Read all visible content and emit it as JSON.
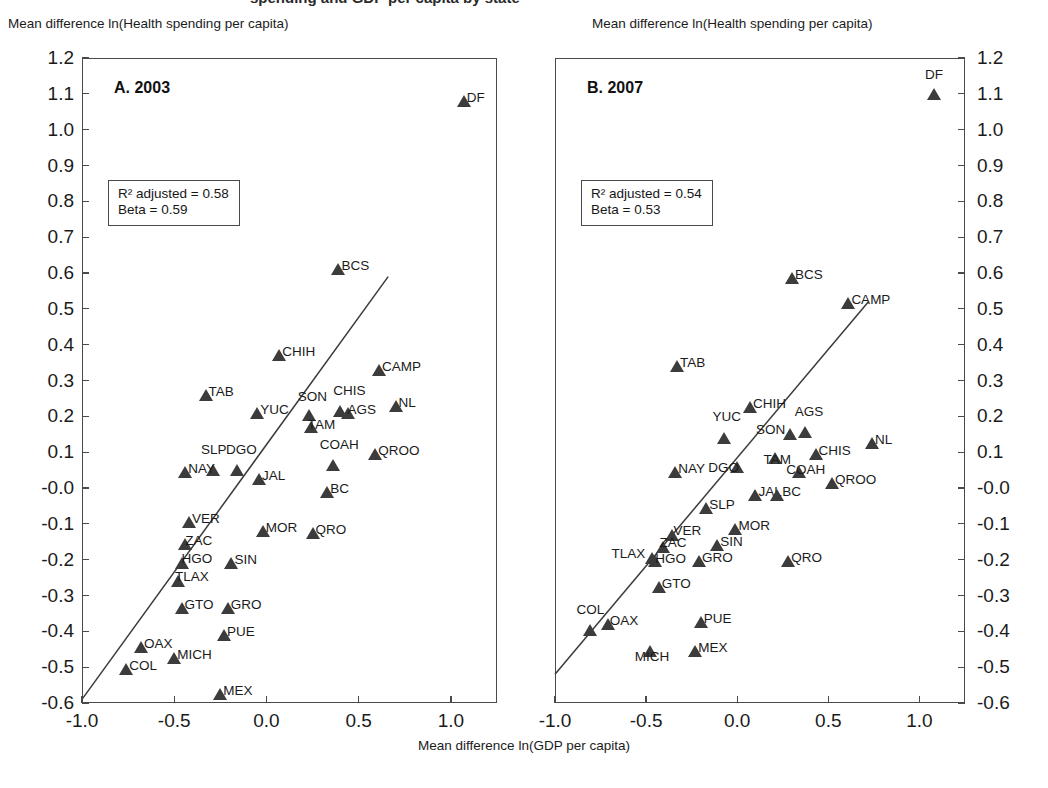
{
  "top_cutoff_text": "spending and GDP per capita by state",
  "axis": {
    "y_title": "Mean difference ln(Health spending per capita)",
    "x_title": "Mean difference ln(GDP per capita)",
    "y_ticks": [
      "1.2",
      "1.1",
      "1.0",
      "0.9",
      "0.8",
      "0.7",
      "0.6",
      "0.5",
      "0.4",
      "0.3",
      "0.2",
      "0.1",
      "-0.0",
      "-0.1",
      "-0.2",
      "-0.3",
      "-0.4",
      "-0.5",
      "-0.6"
    ],
    "x_ticks": [
      "-1.0",
      "-0.5",
      "0.0",
      "0.5",
      "1.0"
    ]
  },
  "chart_data": {
    "type": "scatter",
    "title": "",
    "xlabel": "Mean difference ln(GDP per capita)",
    "ylabel": "Mean difference ln(Health spending per capita)",
    "xlim": [
      -1.0,
      1.25
    ],
    "ylim": [
      -0.6,
      1.2
    ],
    "grid": false,
    "legend": "none",
    "panels": [
      {
        "id": "A",
        "label": "A. 2003",
        "stats": {
          "r2_adjusted": "R² adjusted = 0.58",
          "beta": "Beta = 0.59"
        },
        "r2_adjusted_value": 0.58,
        "beta_value": 0.59,
        "fit_line": {
          "x0": -1.0,
          "y0": -0.59,
          "x1": 0.66,
          "y1": 0.59
        },
        "points": [
          {
            "name": "DF",
            "x": 1.07,
            "y": 1.08,
            "lx": 10,
            "ly": -4
          },
          {
            "name": "BCS",
            "x": 0.39,
            "y": 0.61,
            "lx": 10,
            "ly": -4
          },
          {
            "name": "CHIH",
            "x": 0.07,
            "y": 0.37,
            "lx": 10,
            "ly": -4
          },
          {
            "name": "CAMP",
            "x": 0.61,
            "y": 0.33,
            "lx": 10,
            "ly": -4
          },
          {
            "name": "TAB",
            "x": -0.33,
            "y": 0.26,
            "lx": 10,
            "ly": -4
          },
          {
            "name": "NL",
            "x": 0.7,
            "y": 0.23,
            "lx": 10,
            "ly": -4
          },
          {
            "name": "CHIS",
            "x": 0.4,
            "y": 0.215,
            "lx": 0,
            "ly": -21
          },
          {
            "name": "AGS",
            "x": 0.44,
            "y": 0.21,
            "lx": 7,
            "ly": -4
          },
          {
            "name": "SON",
            "x": 0.23,
            "y": 0.205,
            "lx": -4,
            "ly": -19
          },
          {
            "name": "YUC",
            "x": -0.05,
            "y": 0.21,
            "lx": 10,
            "ly": -4
          },
          {
            "name": "TAM",
            "x": 0.24,
            "y": 0.17,
            "lx": 4,
            "ly": -3
          },
          {
            "name": "QROO",
            "x": 0.59,
            "y": 0.095,
            "lx": 10,
            "ly": -4
          },
          {
            "name": "COAH",
            "x": 0.36,
            "y": 0.065,
            "lx": -6,
            "ly": -21
          },
          {
            "name": "SLP",
            "x": -0.29,
            "y": 0.05,
            "lx": -5,
            "ly": -21
          },
          {
            "name": "DGO",
            "x": -0.16,
            "y": 0.05,
            "lx": -4,
            "ly": -21
          },
          {
            "name": "NAY",
            "x": -0.44,
            "y": 0.045,
            "lx": 10,
            "ly": -4
          },
          {
            "name": "JAL",
            "x": -0.04,
            "y": 0.025,
            "lx": 10,
            "ly": -4
          },
          {
            "name": "BC",
            "x": 0.33,
            "y": -0.01,
            "lx": 10,
            "ly": -4
          },
          {
            "name": "VER",
            "x": -0.42,
            "y": -0.095,
            "lx": 10,
            "ly": -4
          },
          {
            "name": "MOR",
            "x": -0.02,
            "y": -0.12,
            "lx": 10,
            "ly": -4
          },
          {
            "name": "QRO",
            "x": 0.25,
            "y": -0.125,
            "lx": 10,
            "ly": -4
          },
          {
            "name": "ZAC",
            "x": -0.44,
            "y": -0.155,
            "lx": 7,
            "ly": -4
          },
          {
            "name": "SIN",
            "x": -0.19,
            "y": -0.21,
            "lx": 10,
            "ly": -4
          },
          {
            "name": "HGO",
            "x": -0.46,
            "y": -0.21,
            "lx": 7,
            "ly": -5
          },
          {
            "name": "TLAX",
            "x": -0.48,
            "y": -0.26,
            "lx": 4,
            "ly": -5
          },
          {
            "name": "GTO",
            "x": -0.46,
            "y": -0.335,
            "lx": 10,
            "ly": -4
          },
          {
            "name": "GRO",
            "x": -0.21,
            "y": -0.335,
            "lx": 10,
            "ly": -4
          },
          {
            "name": "PUE",
            "x": -0.23,
            "y": -0.41,
            "lx": 10,
            "ly": -4
          },
          {
            "name": "OAX",
            "x": -0.68,
            "y": -0.445,
            "lx": 10,
            "ly": -4
          },
          {
            "name": "MICH",
            "x": -0.5,
            "y": -0.475,
            "lx": 10,
            "ly": -4
          },
          {
            "name": "COL",
            "x": -0.76,
            "y": -0.505,
            "lx": 10,
            "ly": -4
          },
          {
            "name": "MEX",
            "x": -0.25,
            "y": -0.575,
            "lx": 10,
            "ly": -4
          }
        ]
      },
      {
        "id": "B",
        "label": "B. 2007",
        "stats": {
          "r2_adjusted": "R² adjusted = 0.54",
          "beta": "Beta = 0.53"
        },
        "r2_adjusted_value": 0.54,
        "beta_value": 0.53,
        "fit_line": {
          "x0": -1.0,
          "y0": -0.52,
          "x1": 0.72,
          "y1": 0.52
        },
        "points": [
          {
            "name": "DF",
            "x": 1.08,
            "y": 1.1,
            "lx": -2,
            "ly": -20
          },
          {
            "name": "BCS",
            "x": 0.3,
            "y": 0.585,
            "lx": 10,
            "ly": -4
          },
          {
            "name": "CAMP",
            "x": 0.61,
            "y": 0.515,
            "lx": 10,
            "ly": -4
          },
          {
            "name": "TAB",
            "x": -0.33,
            "y": 0.34,
            "lx": 10,
            "ly": -4
          },
          {
            "name": "CHIH",
            "x": 0.07,
            "y": 0.225,
            "lx": 10,
            "ly": -4
          },
          {
            "name": "AGS",
            "x": 0.37,
            "y": 0.155,
            "lx": -3,
            "ly": -21
          },
          {
            "name": "SON",
            "x": 0.29,
            "y": 0.15,
            "lx": -27,
            "ly": -5
          },
          {
            "name": "YUC",
            "x": -0.07,
            "y": 0.14,
            "lx": -5,
            "ly": -22
          },
          {
            "name": "NL",
            "x": 0.74,
            "y": 0.125,
            "lx": 10,
            "ly": -4
          },
          {
            "name": "CHIS",
            "x": 0.43,
            "y": 0.095,
            "lx": 10,
            "ly": -4
          },
          {
            "name": "TAM",
            "x": 0.21,
            "y": 0.085,
            "lx": -5,
            "ly": 1
          },
          {
            "name": "DGO",
            "x": 0.0,
            "y": 0.06,
            "lx": -22,
            "ly": 0
          },
          {
            "name": "COAH",
            "x": 0.34,
            "y": 0.045,
            "lx": -6,
            "ly": -3
          },
          {
            "name": "NAY",
            "x": -0.34,
            "y": 0.045,
            "lx": 10,
            "ly": -4
          },
          {
            "name": "QROO",
            "x": 0.52,
            "y": 0.015,
            "lx": 10,
            "ly": -4
          },
          {
            "name": "JAL",
            "x": 0.1,
            "y": -0.02,
            "lx": 10,
            "ly": -4
          },
          {
            "name": "BC",
            "x": 0.22,
            "y": -0.02,
            "lx": 12,
            "ly": -4
          },
          {
            "name": "SLP",
            "x": -0.17,
            "y": -0.055,
            "lx": 10,
            "ly": -4
          },
          {
            "name": "MOR",
            "x": -0.01,
            "y": -0.115,
            "lx": 10,
            "ly": -4
          },
          {
            "name": "VER",
            "x": -0.36,
            "y": -0.13,
            "lx": 9,
            "ly": -5
          },
          {
            "name": "SIN",
            "x": -0.11,
            "y": -0.16,
            "lx": 10,
            "ly": -4
          },
          {
            "name": "ZAC",
            "x": -0.41,
            "y": -0.165,
            "lx": 4,
            "ly": -5
          },
          {
            "name": "TLAX",
            "x": -0.47,
            "y": -0.195,
            "lx": -33,
            "ly": -5
          },
          {
            "name": "QRO",
            "x": 0.28,
            "y": -0.205,
            "lx": 10,
            "ly": -4
          },
          {
            "name": "HGO",
            "x": -0.45,
            "y": -0.205,
            "lx": 7,
            "ly": -3
          },
          {
            "name": "GRO",
            "x": -0.21,
            "y": -0.205,
            "lx": 10,
            "ly": -4
          },
          {
            "name": "GTO",
            "x": -0.43,
            "y": -0.275,
            "lx": 10,
            "ly": -4
          },
          {
            "name": "PUE",
            "x": -0.2,
            "y": -0.375,
            "lx": 10,
            "ly": -4
          },
          {
            "name": "OAX",
            "x": -0.71,
            "y": -0.38,
            "lx": 9,
            "ly": -4
          },
          {
            "name": "COL",
            "x": -0.81,
            "y": -0.395,
            "lx": -6,
            "ly": -21
          },
          {
            "name": "MICH",
            "x": -0.48,
            "y": -0.455,
            "lx": -8,
            "ly": 5
          },
          {
            "name": "MEX",
            "x": -0.23,
            "y": -0.455,
            "lx": 10,
            "ly": -4
          }
        ]
      }
    ]
  }
}
